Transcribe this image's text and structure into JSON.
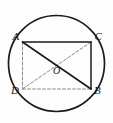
{
  "figure": {
    "background_color": "#fdfdfd",
    "stroke_color": "#1a1a1a",
    "light_stroke_color": "#8a8a8a",
    "circle": {
      "name": "circumscribed-circle",
      "center_x": 56.5,
      "center_y": 63.5,
      "radius": 48,
      "stroke_width": 1.7,
      "style": "solid"
    },
    "points": [
      {
        "id": "A",
        "label": "A",
        "x": 22.5,
        "y": 42.0,
        "label_x": 12.5,
        "label_y": 40.0
      },
      {
        "id": "C",
        "label": "C",
        "x": 91.0,
        "y": 42.0,
        "label_x": 94.5,
        "label_y": 40.0
      },
      {
        "id": "D",
        "label": "D",
        "x": 22.5,
        "y": 89.0,
        "label_x": 11.0,
        "label_y": 93.5
      },
      {
        "id": "B",
        "label": "B",
        "x": 91.0,
        "y": 89.0,
        "label_x": 94.0,
        "label_y": 93.5
      },
      {
        "id": "O",
        "label": "O",
        "x": 56.5,
        "y": 63.5,
        "label_x": 53.0,
        "label_y": 74.0
      }
    ],
    "segments": [
      {
        "id": "AC",
        "from": "A",
        "to": "C",
        "style": "solid",
        "stroke_width": 1.5,
        "color": "#1a1a1a"
      },
      {
        "id": "CB",
        "from": "C",
        "to": "B",
        "style": "solid",
        "stroke_width": 1.5,
        "color": "#1a1a1a"
      },
      {
        "id": "AB",
        "from": "A",
        "to": "B",
        "style": "solid",
        "stroke_width": 1.6,
        "color": "#1a1a1a"
      },
      {
        "id": "AD",
        "from": "A",
        "to": "D",
        "style": "dashed",
        "stroke_width": 1.0,
        "color": "#8a8a8a"
      },
      {
        "id": "DB",
        "from": "D",
        "to": "B",
        "style": "dashed",
        "stroke_width": 1.0,
        "color": "#8a8a8a"
      },
      {
        "id": "DC",
        "from": "D",
        "to": "C",
        "style": "dashed",
        "stroke_width": 1.0,
        "color": "#8a8a8a"
      }
    ]
  }
}
